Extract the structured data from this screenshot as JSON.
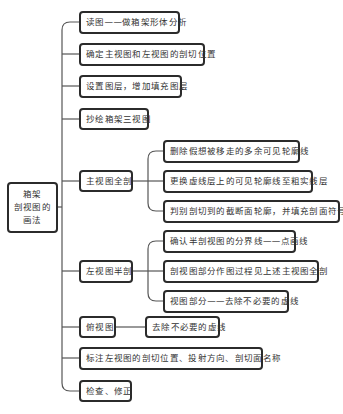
{
  "root": {
    "lines": [
      "箱架",
      "剖视图的",
      "画法"
    ]
  },
  "steps": [
    {
      "label": "读图——做箱架形体分析"
    },
    {
      "label": "确定主视图和左视图的剖切位置"
    },
    {
      "label": "设置图层，增加填充图层"
    },
    {
      "label": "抄绘箱架三视图"
    },
    {
      "label": "主视图全剖",
      "children": [
        "删除假想被移走的多余可见轮廓线",
        "更换虚线层上的可见轮廓线至粗实线层",
        "判别剖切到的截断面轮廓，并填充剖面符号"
      ]
    },
    {
      "label": "左视图半剖",
      "children": [
        "确认半剖视图的分界线——点画线",
        "剖视图部分作图过程见上述主视图全剖",
        "视图部分——去除不必要的虚线"
      ]
    },
    {
      "label": "俯视图",
      "children": [
        "去除不必要的虚线"
      ]
    },
    {
      "label": "标注左视图的剖切位置、投射方向、剖切面名称"
    },
    {
      "label": "检查、修正"
    }
  ],
  "colors": {
    "line": "#555555",
    "border": "#2b2b2b",
    "background": "#ffffff"
  }
}
